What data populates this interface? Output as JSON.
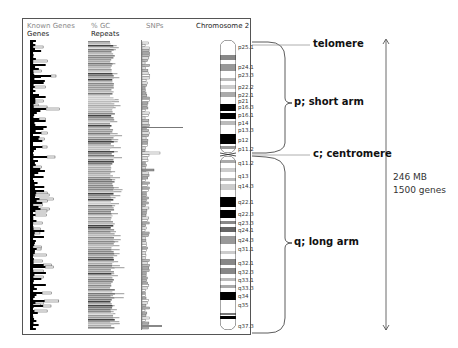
{
  "headers": {
    "known_genes": "Known Genes",
    "genes": "Genes",
    "gc": "% GC",
    "repeats": "Repeats",
    "snps": "SNPs",
    "chromosome": "Chromosome 2"
  },
  "chromosome": {
    "name": "Chromosome 2",
    "bands": [
      {
        "label": "p25.1",
        "y": 47
      },
      {
        "label": "p24.1",
        "y": 67
      },
      {
        "label": "p23.3",
        "y": 75
      },
      {
        "label": "p22.2",
        "y": 87
      },
      {
        "label": "p22.1",
        "y": 95
      },
      {
        "label": "p21",
        "y": 101
      },
      {
        "label": "p16.3",
        "y": 107
      },
      {
        "label": "p16.1",
        "y": 115
      },
      {
        "label": "p14",
        "y": 123
      },
      {
        "label": "p13.3",
        "y": 130
      },
      {
        "label": "p12",
        "y": 140
      },
      {
        "label": "p11.2",
        "y": 149
      },
      {
        "label": "q11.2",
        "y": 163
      },
      {
        "label": "q13",
        "y": 176
      },
      {
        "label": "q14.3",
        "y": 186
      },
      {
        "label": "q22.1",
        "y": 202
      },
      {
        "label": "q22.3",
        "y": 214
      },
      {
        "label": "q23.3",
        "y": 223
      },
      {
        "label": "q24.1",
        "y": 230
      },
      {
        "label": "q24.3",
        "y": 240
      },
      {
        "label": "q31.1",
        "y": 249
      },
      {
        "label": "q32.1",
        "y": 263
      },
      {
        "label": "q32.3",
        "y": 272
      },
      {
        "label": "q33.1",
        "y": 280
      },
      {
        "label": "q33.3",
        "y": 288
      },
      {
        "label": "q34",
        "y": 296
      },
      {
        "label": "q35",
        "y": 305
      },
      {
        "label": "q37.3",
        "y": 326
      }
    ]
  },
  "annotations": {
    "telomere": "telomere",
    "short_arm": "p; short arm",
    "centromere": "c; centromere",
    "long_arm": "q; long arm"
  },
  "size": {
    "length": "246 MB",
    "genes": "1500 genes"
  }
}
